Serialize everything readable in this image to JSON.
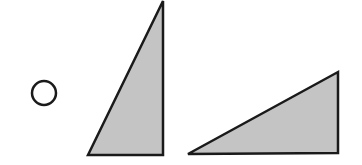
{
  "figure": {
    "width": 362,
    "height": 165,
    "background": "#ffffff",
    "stroke_color": "#1a1a1a",
    "fill_color": "#c4c4c4",
    "shapes": [
      {
        "type": "circle",
        "name": "option-circle",
        "cx": 44,
        "cy": 93,
        "r": 12,
        "fill": "none"
      },
      {
        "type": "triangle",
        "name": "tall-right-triangle",
        "points": "88,155 163,1 163,155"
      },
      {
        "type": "triangle",
        "name": "wide-right-triangle",
        "points": "188,154 338,72 338,153"
      }
    ]
  }
}
